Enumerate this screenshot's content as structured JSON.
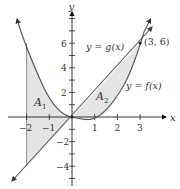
{
  "figure": {
    "axis_labels": {
      "x": "x",
      "y": "y"
    },
    "x_ticks": [
      {
        "value": -2,
        "label": "−2"
      },
      {
        "value": -1,
        "label": "−1"
      },
      {
        "value": 1,
        "label": "1"
      },
      {
        "value": 2,
        "label": "2"
      },
      {
        "value": 3,
        "label": "3"
      }
    ],
    "y_ticks": [
      {
        "value": 6,
        "label": "6"
      },
      {
        "value": 4,
        "label": "4"
      },
      {
        "value": 2,
        "label": "2"
      },
      {
        "value": -2,
        "label": "−2"
      },
      {
        "value": -4,
        "label": "−4"
      }
    ],
    "curves": {
      "g_label": "y = g(x)",
      "f_label": "y = f(x)"
    },
    "point_label": "(3, 6)",
    "regions": {
      "a1": {
        "base": "A",
        "sub": "1"
      },
      "a2": {
        "base": "A",
        "sub": "2"
      }
    },
    "colors": {
      "curve": "#555555",
      "shade": "#e2e2e2",
      "axis": "#222222",
      "text": "#333333"
    }
  }
}
